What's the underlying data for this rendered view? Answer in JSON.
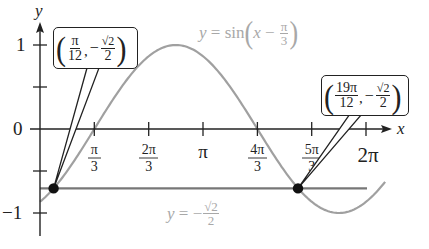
{
  "chart_data": {
    "type": "line",
    "title": "",
    "xlabel": "x",
    "ylabel": "y",
    "xlim": [
      0,
      6.8
    ],
    "ylim": [
      -1.2,
      1.2
    ],
    "grid": false,
    "x_ticks": [
      {
        "value": 1.0472,
        "label": "π/3",
        "num": "π",
        "den": "3"
      },
      {
        "value": 2.0944,
        "label": "2π/3",
        "num": "2π",
        "den": "3"
      },
      {
        "value": 3.1416,
        "label": "π"
      },
      {
        "value": 4.1888,
        "label": "4π/3",
        "num": "4π",
        "den": "3"
      },
      {
        "value": 5.236,
        "label": "5π/3",
        "num": "5π",
        "den": "3"
      },
      {
        "value": 6.2832,
        "label": "2π"
      }
    ],
    "y_ticks": [
      {
        "value": 1,
        "label": "1"
      },
      {
        "value": 0.5,
        "label": ""
      },
      {
        "value": 0,
        "label": "0"
      },
      {
        "value": -0.5,
        "label": ""
      },
      {
        "value": -1,
        "label": "-1"
      }
    ],
    "series": [
      {
        "name": "y = sin(x − π/3)",
        "expression": "sin(x - pi/3)",
        "color": "#a0a0a0",
        "x_range": [
          0,
          6.65
        ],
        "sample_points": [
          {
            "x": 0,
            "y": -0.866
          },
          {
            "x": 0.2618,
            "y": -0.7071
          },
          {
            "x": 1.0472,
            "y": 0
          },
          {
            "x": 2.618,
            "y": 0.9659
          },
          {
            "x": 4.1888,
            "y": 0
          },
          {
            "x": 4.7124,
            "y": -0.5
          },
          {
            "x": 4.9742,
            "y": -0.7071
          },
          {
            "x": 5.7596,
            "y": -1
          },
          {
            "x": 6.65,
            "y": -0.85
          }
        ]
      },
      {
        "name": "y = −√2/2",
        "expression": "-sqrt(2)/2",
        "color": "#777777",
        "x_range": [
          0,
          6.65
        ],
        "values": [
          -0.7071,
          -0.7071
        ]
      }
    ],
    "annotations": [
      {
        "type": "point",
        "x": 0.2618,
        "y": -0.7071,
        "label": "(π/12, −√2/2)"
      },
      {
        "type": "point",
        "x": 4.9742,
        "y": -0.7071,
        "label": "(19π/12, −√2/2)"
      },
      {
        "type": "text",
        "label": "y = sin(x − π/3)"
      },
      {
        "type": "text",
        "label": "y = −√2/2"
      }
    ]
  },
  "labels": {
    "y_axis": "y",
    "x_axis": "x",
    "y_one": "1",
    "y_zero": "0",
    "y_neg_one": "−1",
    "tick_pi_thirds_num": "π",
    "tick_pi_thirds_den": "3",
    "tick_two_pi_thirds_num": "2π",
    "tick_two_pi_thirds_den": "3",
    "tick_pi": "π",
    "tick_four_pi_thirds_num": "4π",
    "tick_four_pi_thirds_den": "3",
    "tick_five_pi_thirds_num": "5π",
    "tick_five_pi_thirds_den": "3",
    "tick_two_pi": "2π"
  },
  "callouts": {
    "left": {
      "paren_open": "(",
      "x_num": "π",
      "x_den": "12",
      "comma": ",",
      "minus": "−",
      "y_num": "√2",
      "y_den": "2",
      "paren_close": ")"
    },
    "right": {
      "paren_open": "(",
      "x_num": "19π",
      "x_den": "12",
      "comma": ",",
      "minus": "−",
      "y_num": "√2",
      "y_den": "2",
      "paren_close": ")"
    }
  },
  "equations": {
    "sine": {
      "y": "y",
      "eq": " = sin",
      "open": "(",
      "x": "x",
      "minus": " − ",
      "num": "π",
      "den": "3",
      "close": ")"
    },
    "line": {
      "y": "y",
      "eq": " = −",
      "num": "√2",
      "den": "2"
    }
  },
  "colors": {
    "axis": "#222222",
    "sine_curve": "#a0a0a0",
    "horizontal_line": "#777777",
    "points": "#111111",
    "equation_text": "#a8a8a8"
  }
}
